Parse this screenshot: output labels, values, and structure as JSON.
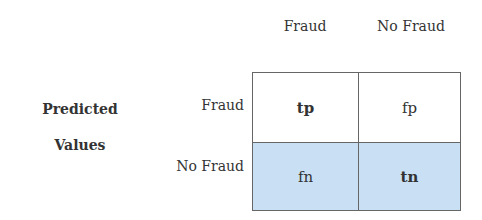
{
  "columns": [
    "Fraud",
    "No Fraud"
  ],
  "rows": [
    "Fraud",
    "No Fraud"
  ],
  "side_label": [
    "Predicted",
    "Values"
  ],
  "cells": [
    [
      "tp",
      "fp"
    ],
    [
      "fn",
      "tn"
    ]
  ],
  "colors": {
    "shaded_row": "#c9e0f4",
    "border": "#666666"
  }
}
